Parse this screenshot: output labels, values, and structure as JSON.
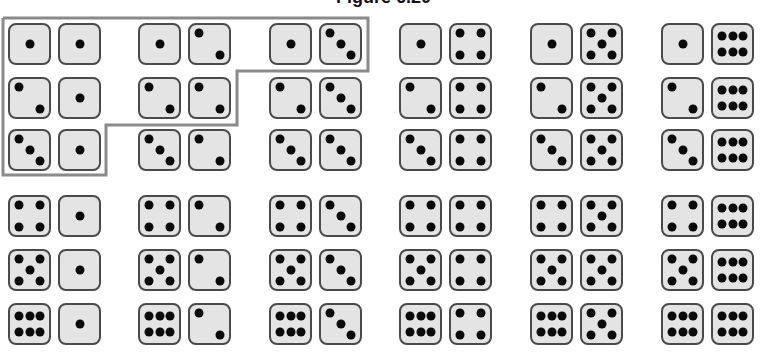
{
  "figure": {
    "title": "Figure 6.20",
    "colors": {
      "die_face": "#e4e4e4",
      "die_border": "#4a4a4a",
      "pip": "#0a0a0a",
      "highlight_outline": "#8a8a8a"
    },
    "rows": [
      [
        [
          1,
          1
        ],
        [
          1,
          2
        ],
        [
          1,
          3
        ],
        [
          1,
          4
        ],
        [
          1,
          5
        ],
        [
          1,
          6
        ]
      ],
      [
        [
          2,
          1
        ],
        [
          2,
          2
        ],
        [
          2,
          3
        ],
        [
          2,
          4
        ],
        [
          2,
          5
        ],
        [
          2,
          6
        ]
      ],
      [
        [
          3,
          1
        ],
        [
          3,
          2
        ],
        [
          3,
          3
        ],
        [
          3,
          4
        ],
        [
          3,
          5
        ],
        [
          3,
          6
        ]
      ],
      [
        [
          4,
          1
        ],
        [
          4,
          2
        ],
        [
          4,
          3
        ],
        [
          4,
          4
        ],
        [
          4,
          5
        ],
        [
          4,
          6
        ]
      ],
      [
        [
          5,
          1
        ],
        [
          5,
          2
        ],
        [
          5,
          3
        ],
        [
          5,
          4
        ],
        [
          5,
          5
        ],
        [
          5,
          6
        ]
      ],
      [
        [
          6,
          1
        ],
        [
          6,
          2
        ],
        [
          6,
          3
        ],
        [
          6,
          4
        ],
        [
          6,
          5
        ],
        [
          6,
          6
        ]
      ]
    ],
    "highlighted": [
      [
        1,
        1
      ],
      [
        1,
        2
      ],
      [
        1,
        3
      ],
      [
        2,
        1
      ],
      [
        2,
        2
      ],
      [
        3,
        1
      ]
    ]
  }
}
